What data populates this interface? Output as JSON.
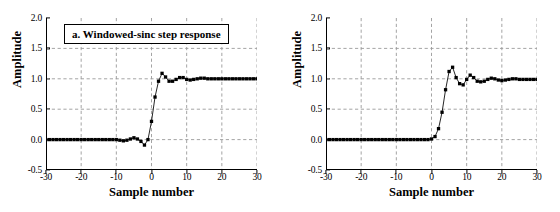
{
  "figure": {
    "background": "#ffffff",
    "ink": "#000000",
    "grid_color": "#9a9a9a"
  },
  "panels": [
    {
      "id": "a",
      "title": "a.  Windowed-sinc step response",
      "xlabel": "Sample number",
      "ylabel": "Amplitude",
      "yticks": [
        "2.0",
        "1.5",
        "1.0",
        "0.5",
        "0.0",
        "-0.5"
      ],
      "ytick_values": [
        2.0,
        1.5,
        1.0,
        0.5,
        0.0,
        -0.5
      ],
      "xticks": [
        "-30",
        "-20",
        "-10",
        "0",
        "10",
        "20",
        "30"
      ],
      "xtick_values": [
        -30,
        -20,
        -10,
        0,
        10,
        20,
        30
      ]
    },
    {
      "id": "b",
      "title": "b.  Chebyshev step response",
      "xlabel": "Sample number",
      "ylabel": "Amplitude",
      "yticks": [
        "2.0",
        "1.5",
        "1.0",
        "0.5",
        "0.0",
        "-0.5"
      ],
      "ytick_values": [
        2.0,
        1.5,
        1.0,
        0.5,
        0.0,
        -0.5
      ],
      "xticks": [
        "-30",
        "-20",
        "-10",
        "0",
        "10",
        "20",
        "30"
      ],
      "xtick_values": [
        -30,
        -20,
        -10,
        0,
        10,
        20,
        30
      ]
    }
  ],
  "chart_data": [
    {
      "type": "line",
      "panel": "a",
      "title": "a.  Windowed-sinc step response",
      "xlabel": "Sample number",
      "ylabel": "Amplitude",
      "xlim": [
        -30,
        30
      ],
      "ylim": [
        -0.5,
        2.0
      ],
      "grid": true,
      "marker": "square",
      "legend": "none",
      "x": [
        -30,
        -29,
        -28,
        -27,
        -26,
        -25,
        -24,
        -23,
        -22,
        -21,
        -20,
        -19,
        -18,
        -17,
        -16,
        -15,
        -14,
        -13,
        -12,
        -11,
        -10,
        -9,
        -8,
        -7,
        -6,
        -5,
        -4,
        -3,
        -2,
        -1,
        0,
        1,
        2,
        3,
        4,
        5,
        6,
        7,
        8,
        9,
        10,
        11,
        12,
        13,
        14,
        15,
        16,
        17,
        18,
        19,
        20,
        21,
        22,
        23,
        24,
        25,
        26,
        27,
        28,
        29,
        30
      ],
      "y": [
        0.0,
        0.0,
        0.0,
        0.0,
        0.0,
        0.0,
        0.0,
        0.0,
        0.0,
        0.0,
        0.0,
        0.0,
        0.0,
        0.0,
        0.0,
        0.0,
        0.0,
        0.0,
        0.0,
        0.0,
        0.0,
        -0.01,
        -0.02,
        -0.01,
        0.01,
        0.03,
        0.01,
        -0.03,
        -0.09,
        0.0,
        0.3,
        0.7,
        0.96,
        1.09,
        1.03,
        0.96,
        0.96,
        0.99,
        1.02,
        1.02,
        0.99,
        0.98,
        0.99,
        1.0,
        1.01,
        1.01,
        1.0,
        1.0,
        1.0,
        1.0,
        1.0,
        1.0,
        1.0,
        1.0,
        1.0,
        1.0,
        1.0,
        1.0,
        1.0,
        1.0,
        1.0
      ]
    },
    {
      "type": "line",
      "panel": "b",
      "title": "b.  Chebyshev step response",
      "xlabel": "Sample number",
      "ylabel": "Amplitude",
      "xlim": [
        -30,
        30
      ],
      "ylim": [
        -0.5,
        2.0
      ],
      "grid": true,
      "marker": "square",
      "legend": "none",
      "x": [
        -30,
        -29,
        -28,
        -27,
        -26,
        -25,
        -24,
        -23,
        -22,
        -21,
        -20,
        -19,
        -18,
        -17,
        -16,
        -15,
        -14,
        -13,
        -12,
        -11,
        -10,
        -9,
        -8,
        -7,
        -6,
        -5,
        -4,
        -3,
        -2,
        -1,
        0,
        1,
        2,
        3,
        4,
        5,
        6,
        7,
        8,
        9,
        10,
        11,
        12,
        13,
        14,
        15,
        16,
        17,
        18,
        19,
        20,
        21,
        22,
        23,
        24,
        25,
        26,
        27,
        28,
        29,
        30
      ],
      "y": [
        0.0,
        0.0,
        0.0,
        0.0,
        0.0,
        0.0,
        0.0,
        0.0,
        0.0,
        0.0,
        0.0,
        0.0,
        0.0,
        0.0,
        0.0,
        0.0,
        0.0,
        0.0,
        0.0,
        0.0,
        0.0,
        0.0,
        0.0,
        0.0,
        0.0,
        0.0,
        0.0,
        0.0,
        0.0,
        0.0,
        0.01,
        0.05,
        0.18,
        0.45,
        0.82,
        1.12,
        1.19,
        1.02,
        0.92,
        0.9,
        0.99,
        1.06,
        1.02,
        0.96,
        0.95,
        0.96,
        0.99,
        1.01,
        1.0,
        0.98,
        0.97,
        0.98,
        0.99,
        1.0,
        1.0,
        0.99,
        0.99,
        0.99,
        0.99,
        0.99,
        0.99
      ]
    }
  ]
}
